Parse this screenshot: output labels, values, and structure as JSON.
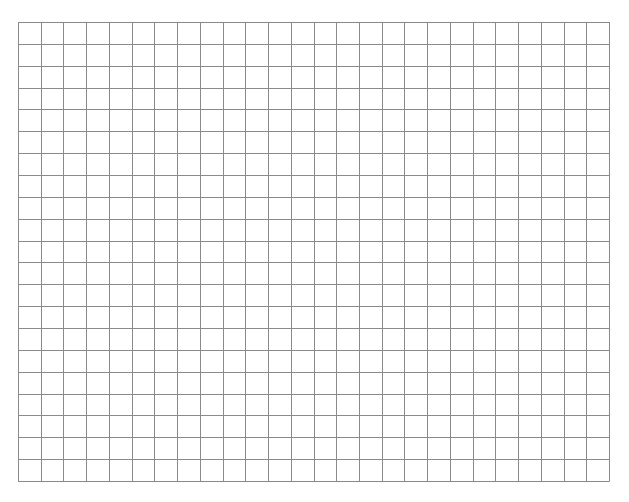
{
  "grid": {
    "columns": 26,
    "rows": 21,
    "left": 18,
    "top": 22,
    "width": 591,
    "height": 459,
    "line_color": "#8a8a8a",
    "background": "#ffffff"
  }
}
